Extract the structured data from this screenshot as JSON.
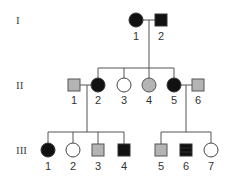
{
  "colors": {
    "affected": "#111111",
    "carrier": "#b4b4b4",
    "unaffected": "#ffffff",
    "stroke": "#444444",
    "line": "#555555"
  },
  "generations": [
    {
      "label": "I",
      "y": 20
    },
    {
      "label": "II",
      "y": 85
    },
    {
      "label": "III",
      "y": 150
    }
  ],
  "individuals": {
    "I": [
      {
        "id": "1",
        "sex": "female",
        "status": "affected",
        "x": 136
      },
      {
        "id": "2",
        "sex": "male",
        "status": "affected",
        "x": 161
      }
    ],
    "II": [
      {
        "id": "1",
        "sex": "male",
        "status": "carrier",
        "x": 74
      },
      {
        "id": "2",
        "sex": "female",
        "status": "affected",
        "x": 98
      },
      {
        "id": "3",
        "sex": "female",
        "status": "unaffected",
        "x": 124
      },
      {
        "id": "4",
        "sex": "female",
        "status": "carrier",
        "x": 149
      },
      {
        "id": "5",
        "sex": "female",
        "status": "affected",
        "x": 174
      },
      {
        "id": "6",
        "sex": "male",
        "status": "carrier",
        "x": 198
      }
    ],
    "III": [
      {
        "id": "1",
        "sex": "female",
        "status": "affected",
        "x": 48
      },
      {
        "id": "2",
        "sex": "female",
        "status": "unaffected",
        "x": 73
      },
      {
        "id": "3",
        "sex": "male",
        "status": "carrier",
        "x": 98
      },
      {
        "id": "4",
        "sex": "male",
        "status": "affected",
        "x": 124
      },
      {
        "id": "5",
        "sex": "male",
        "status": "carrier",
        "x": 161
      },
      {
        "id": "6",
        "sex": "male",
        "status": "affected",
        "x": 186
      },
      {
        "id": "7",
        "sex": "female",
        "status": "unaffected",
        "x": 211
      }
    ]
  }
}
